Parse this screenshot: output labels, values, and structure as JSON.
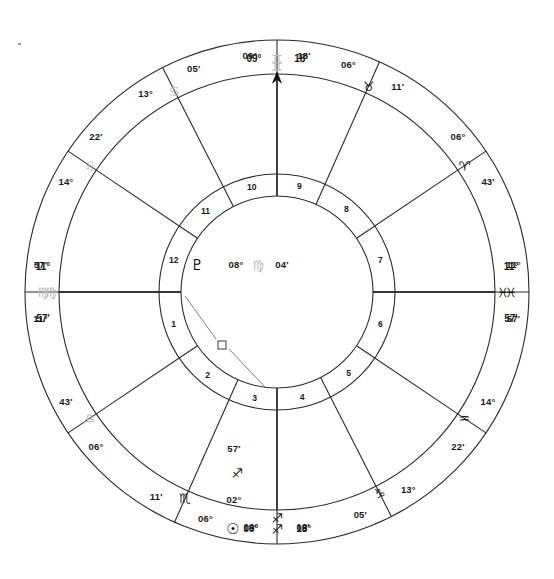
{
  "chart": {
    "type": "astrology-wheel",
    "center": {
      "x": 277,
      "y": 292
    },
    "radii": {
      "outer": 252,
      "zodiac_inner": 218,
      "cusp_inner": 118,
      "house_ring_inner": 96
    },
    "angles": {
      "ascendant": {
        "label_deg": "11°",
        "sign": "♍",
        "label_min": "57'",
        "position": "left"
      },
      "descendant": {
        "label_deg": "11°",
        "sign": "♓",
        "label_min": "57'",
        "position": "right"
      },
      "midheaven": {
        "label_deg": "09°",
        "sign": "♊",
        "label_min": "18'",
        "position": "top"
      },
      "imum_coeli": {
        "label_deg": "09°",
        "sign": "♐",
        "label_min": "18'",
        "position": "bottom"
      }
    },
    "cusps": [
      {
        "house": 1,
        "deg": "11°",
        "sign": "♍",
        "min": "57'",
        "sign_name": "virgo",
        "faint": true,
        "angle": 180
      },
      {
        "house": 2,
        "deg": "06°",
        "sign": "♎",
        "min": "43'",
        "sign_name": "libra",
        "faint": true,
        "angle": 214
      },
      {
        "house": 3,
        "deg": "06°",
        "sign": "♏",
        "min": "11'",
        "sign_name": "scorpio",
        "faint": false,
        "angle": 246
      },
      {
        "house": 4,
        "deg": "09°",
        "sign": "♐",
        "min": "18'",
        "sign_name": "sagittarius",
        "faint": false,
        "angle": 270
      },
      {
        "house": 5,
        "deg": "13°",
        "sign": "♑",
        "min": "05'",
        "sign_name": "capricorn",
        "faint": false,
        "angle": 297
      },
      {
        "house": 6,
        "deg": "14°",
        "sign": "♒",
        "min": "22'",
        "sign_name": "aquarius",
        "faint": false,
        "angle": 326
      },
      {
        "house": 7,
        "deg": "11°",
        "sign": "♓",
        "min": "57'",
        "sign_name": "pisces",
        "faint": false,
        "angle": 0
      },
      {
        "house": 8,
        "deg": "06°",
        "sign": "♈",
        "min": "43'",
        "sign_name": "aries",
        "faint": false,
        "angle": 34
      },
      {
        "house": 9,
        "deg": "06°",
        "sign": "♉",
        "min": "11'",
        "sign_name": "taurus",
        "faint": false,
        "angle": 66
      },
      {
        "house": 10,
        "deg": "09°",
        "sign": "♊",
        "min": "18'",
        "sign_name": "gemini",
        "faint": true,
        "angle": 90
      },
      {
        "house": 11,
        "deg": "13°",
        "sign": "♋",
        "min": "05'",
        "sign_name": "cancer",
        "faint": true,
        "angle": 117
      },
      {
        "house": 12,
        "deg": "14°",
        "sign": "♌",
        "min": "22'",
        "sign_name": "leo",
        "faint": true,
        "angle": 146
      }
    ],
    "house_numbers": [
      "1",
      "2",
      "3",
      "4",
      "5",
      "6",
      "7",
      "8",
      "9",
      "10",
      "11",
      "12"
    ],
    "planets": [
      {
        "name": "pluto",
        "glyph": "♇",
        "deg": "08°",
        "sign": "♍",
        "min": "04'",
        "sign_name": "virgo",
        "at_angle": 183
      },
      {
        "name": "sun",
        "glyph": "☉",
        "deg": "02°",
        "sign": "♐",
        "min": "57'",
        "sign_name": "sagittarius",
        "at_angle": 263
      }
    ],
    "aspects": [
      {
        "symbol": "□",
        "name": "square",
        "between": [
          "ascendant",
          "sun"
        ]
      }
    ],
    "colors": {
      "line": "#2b2b2b",
      "text": "#1a1a1a",
      "faint_glyph": "#b9b9b9",
      "aspect_line": "#6f6f6f",
      "background": "#ffffff"
    }
  }
}
